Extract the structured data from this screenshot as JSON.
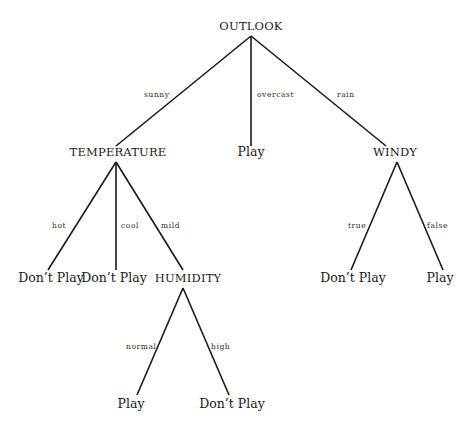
{
  "diagram": {
    "type": "decision-tree",
    "colors": {
      "line": "#1a1a1a",
      "text": "#1a1a1a",
      "background": "#ffffff"
    },
    "nodes": {
      "outlook": {
        "label": "OUTLOOK",
        "kind": "attribute"
      },
      "temperature": {
        "label": "TEMPERATURE",
        "kind": "attribute"
      },
      "overcast_play": {
        "label": "Play",
        "kind": "leaf"
      },
      "windy": {
        "label": "WINDY",
        "kind": "attribute"
      },
      "hot_dont_play": {
        "label": "Don’t Play",
        "kind": "leaf"
      },
      "cool_dont_play": {
        "label": "Don’t Play",
        "kind": "leaf"
      },
      "humidity": {
        "label": "HUMIDITY",
        "kind": "attribute"
      },
      "true_dont_play": {
        "label": "Don’t Play",
        "kind": "leaf"
      },
      "false_play": {
        "label": "Play",
        "kind": "leaf"
      },
      "normal_play": {
        "label": "Play",
        "kind": "leaf"
      },
      "high_dont_play": {
        "label": "Don’t Play",
        "kind": "leaf"
      }
    },
    "edges": {
      "sunny": {
        "label": "sunny",
        "from": "outlook",
        "to": "temperature"
      },
      "overcast": {
        "label": "overcast",
        "from": "outlook",
        "to": "overcast_play"
      },
      "rain": {
        "label": "rain",
        "from": "outlook",
        "to": "windy"
      },
      "hot": {
        "label": "hot",
        "from": "temperature",
        "to": "hot_dont_play"
      },
      "cool": {
        "label": "cool",
        "from": "temperature",
        "to": "cool_dont_play"
      },
      "mild": {
        "label": "mild",
        "from": "temperature",
        "to": "humidity"
      },
      "true": {
        "label": "true",
        "from": "windy",
        "to": "true_dont_play"
      },
      "false": {
        "label": "false",
        "from": "windy",
        "to": "false_play"
      },
      "normal": {
        "label": "normal",
        "from": "humidity",
        "to": "normal_play"
      },
      "high": {
        "label": "high",
        "from": "humidity",
        "to": "high_dont_play"
      }
    }
  }
}
